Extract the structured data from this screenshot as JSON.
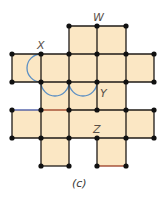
{
  "figure": {
    "caption": "(c)",
    "labels": {
      "W": "W",
      "X": "X",
      "Y": "Y",
      "Z": "Z"
    },
    "colors": {
      "fill": "#fbe7c4",
      "edge": "#1e1a16",
      "vertex": "#111111",
      "arc": "#5b8fc4",
      "edge_blue": "#3f4fa0",
      "edge_red": "#9a3b22"
    },
    "grid": {
      "xs": [
        12,
        41,
        69,
        97,
        126,
        154
      ],
      "ys": [
        26,
        54,
        82,
        110,
        138,
        166
      ]
    },
    "cells": [
      [
        2,
        0
      ],
      [
        3,
        0
      ],
      [
        0,
        1
      ],
      [
        1,
        1
      ],
      [
        2,
        1
      ],
      [
        3,
        1
      ],
      [
        4,
        1
      ],
      [
        1,
        2
      ],
      [
        2,
        2
      ],
      [
        3,
        2
      ],
      [
        0,
        3
      ],
      [
        1,
        3
      ],
      [
        2,
        3
      ],
      [
        3,
        3
      ],
      [
        4,
        3
      ],
      [
        1,
        4
      ],
      [
        3,
        4
      ]
    ]
  }
}
